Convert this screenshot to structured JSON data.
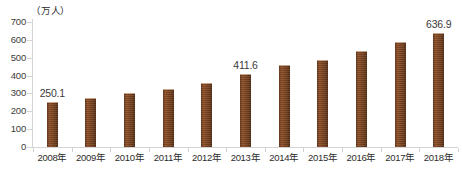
{
  "chart_data": {
    "type": "bar",
    "title": "",
    "subtitle": "",
    "xlabel": "",
    "ylabel": "（万人）",
    "unit_label": "（万人）",
    "categories": [
      "2008年",
      "2009年",
      "2010年",
      "2011年",
      "2012年",
      "2013年",
      "2014年",
      "2015年",
      "2016年",
      "2017年",
      "2018年"
    ],
    "values": [
      250.1,
      276,
      300,
      323,
      358,
      411.6,
      462,
      490,
      540,
      586,
      636.9
    ],
    "point_labels": [
      "250.1",
      "",
      "",
      "",
      "",
      "411.6",
      "",
      "",
      "",
      "",
      "636.9"
    ],
    "labelled_indices": [
      0,
      5,
      10
    ],
    "ylim": [
      0,
      700
    ],
    "yticks": [
      0,
      100,
      200,
      300,
      400,
      500,
      600,
      700
    ],
    "ytick_labels": [
      "0",
      "100",
      "200",
      "300",
      "400",
      "500",
      "600",
      "700"
    ],
    "grid": false,
    "legend": null,
    "legend_position": "none",
    "series_name": "",
    "bar_color": "#7b4320",
    "axis_color": "#d4d4d4",
    "text_color": "#2d2d2d"
  },
  "caption": {
    "text": ""
  }
}
